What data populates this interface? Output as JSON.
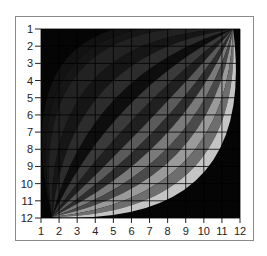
{
  "chart_data": {
    "type": "heatmap",
    "title": "",
    "xlabel": "",
    "ylabel": "",
    "x_ticks": [
      "1",
      "2",
      "3",
      "4",
      "5",
      "6",
      "7",
      "8",
      "9",
      "10",
      "11",
      "12"
    ],
    "y_ticks": [
      "1",
      "2",
      "3",
      "4",
      "5",
      "6",
      "7",
      "8",
      "9",
      "10",
      "11",
      "12"
    ],
    "xlim": [
      1,
      12
    ],
    "ylim": [
      12,
      1
    ],
    "grid": true,
    "legend": null,
    "bands": [
      {
        "bow": 0.05,
        "gray": "#161616"
      },
      {
        "bow": 0.14,
        "gray": "#222222"
      },
      {
        "bow": 0.22,
        "gray": "#161616"
      },
      {
        "bow": 0.3,
        "gray": "#2c2c2c"
      },
      {
        "bow": 0.38,
        "gray": "#0e0e0e"
      },
      {
        "bow": 0.45,
        "gray": "#3a3a3a"
      },
      {
        "bow": 0.52,
        "gray": "#202020"
      },
      {
        "bow": 0.58,
        "gray": "#5a5a5a"
      },
      {
        "bow": 0.64,
        "gray": "#2e2e2e"
      },
      {
        "bow": 0.7,
        "gray": "#7a7a7a"
      },
      {
        "bow": 0.76,
        "gray": "#4a4a4a"
      },
      {
        "bow": 0.82,
        "gray": "#9a9a9a"
      },
      {
        "bow": 0.88,
        "gray": "#6e6e6e"
      },
      {
        "bow": 0.94,
        "gray": "#c4c4c4"
      }
    ]
  },
  "colors": {
    "background": "#050505",
    "grid": "#000000",
    "frame": "#8a8a8a"
  }
}
